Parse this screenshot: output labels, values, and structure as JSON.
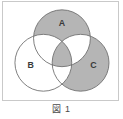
{
  "figure": {
    "caption": "図 1",
    "frame_border_color": "#c9c9c9",
    "background_color": "#ffffff"
  },
  "venn": {
    "shade_color": "#b5b5b5",
    "stroke_color": "#6e6e6e",
    "unshaded_color": "#ffffff",
    "labels": {
      "a": "A",
      "b": "B",
      "c": "C"
    },
    "circles": [
      {
        "id": "A",
        "label": "A",
        "cx": 60,
        "cy": 37,
        "r": 29,
        "label_x": 60,
        "label_y": 22,
        "shaded_only_region": true
      },
      {
        "id": "B",
        "label": "B",
        "cx": 41,
        "cy": 62,
        "r": 29,
        "label_x": 28,
        "label_y": 65,
        "shaded_only_region": false
      },
      {
        "id": "C",
        "label": "C",
        "cx": 79,
        "cy": 62,
        "r": 29,
        "label_x": 92,
        "label_y": 65,
        "shaded_only_region": true
      }
    ],
    "regions": [
      {
        "name": "A-only",
        "expression": "A \\ (B ∪ C)",
        "shaded": true
      },
      {
        "name": "B-only",
        "expression": "B \\ (A ∪ C)",
        "shaded": false
      },
      {
        "name": "C-only",
        "expression": "C \\ (A ∪ B)",
        "shaded": true
      },
      {
        "name": "A-and-B",
        "expression": "(A ∩ B) \\ C",
        "shaded": false
      },
      {
        "name": "A-and-C",
        "expression": "(A ∩ C) \\ B",
        "shaded": false
      },
      {
        "name": "B-and-C",
        "expression": "(B ∩ C) \\ A",
        "shaded": false
      },
      {
        "name": "A-and-B-and-C",
        "expression": "A ∩ B ∩ C",
        "shaded": true
      }
    ]
  }
}
